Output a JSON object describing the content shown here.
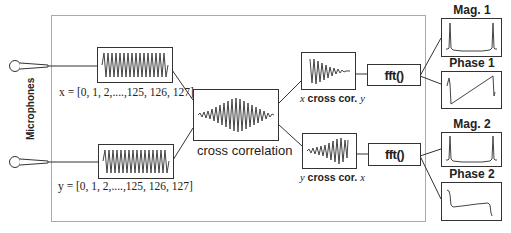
{
  "diagram": {
    "side_label": "Microphones",
    "inputs": [
      {
        "id": "x",
        "var": "x",
        "label": "x = [0, 1, 2,....,125, 126, 127]"
      },
      {
        "id": "y",
        "var": "y",
        "label": "y = [0, 1, 2,....,125, 126, 127]"
      }
    ],
    "cross_correlation": {
      "label": "cross correlation"
    },
    "correlations": [
      {
        "id": "xcy",
        "left": "x",
        "mid": " cross cor. ",
        "right": "y"
      },
      {
        "id": "ycx",
        "left": "y",
        "mid": " cross cor. ",
        "right": "x"
      }
    ],
    "fft": [
      {
        "id": "fft1",
        "label": "fft()"
      },
      {
        "id": "fft2",
        "label": "fft()"
      }
    ],
    "outputs": [
      {
        "id": "mag1",
        "title": "Mag. 1"
      },
      {
        "id": "phase1",
        "title": "Phase 1"
      },
      {
        "id": "mag2",
        "title": "Mag. 2"
      },
      {
        "id": "phase2",
        "title": "Phase 2"
      }
    ],
    "colors": {
      "line": "#333333",
      "border_outer": "#aaaaaa",
      "signal": "#444444"
    }
  }
}
